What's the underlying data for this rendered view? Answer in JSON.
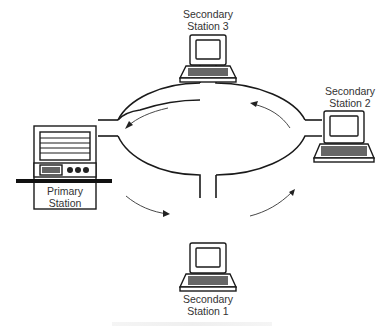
{
  "diagram": {
    "type": "ring-network",
    "stations": [
      {
        "id": "primary",
        "label_line1": "Primary",
        "label_line2": "Station"
      },
      {
        "id": "secondary-1",
        "label_line1": "Secondary",
        "label_line2": "Station 1"
      },
      {
        "id": "secondary-2",
        "label_line1": "Secondary",
        "label_line2": "Station 2"
      },
      {
        "id": "secondary-3",
        "label_line1": "Secondary",
        "label_line2": "Station 3"
      }
    ],
    "flow_direction": "counter-clockwise",
    "colors": {
      "line": "#1a1a1a",
      "background": "#ffffff",
      "text": "#333333"
    }
  }
}
